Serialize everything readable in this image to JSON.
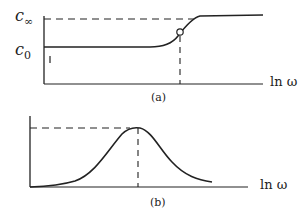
{
  "panel_a": {
    "caption": "(a)",
    "y_label_top": "c",
    "y_label_top_sub": "∞",
    "y_label_bottom": "c",
    "y_label_bottom_sub": "0",
    "x_label": "ln ω",
    "description": "Sigmoidal step of c from c0 to c∞ versus ln ω, with inflection point marked by open circle and dashed drop line"
  },
  "panel_b": {
    "caption": "(b)",
    "x_label": "ln ω",
    "description": "Bell-shaped peak versus ln ω, with dashed lines marking peak height and position"
  },
  "colors": {
    "ink": "#222222",
    "background": "#ffffff"
  }
}
